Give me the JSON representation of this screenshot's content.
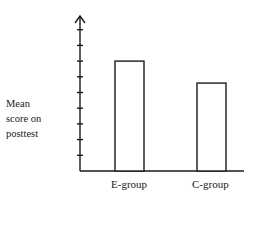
{
  "chart_data": {
    "type": "bar",
    "title": "",
    "xlabel": "",
    "ylabel": "Mean score on posttest",
    "ylabel_lines": [
      "Mean",
      "score on",
      "posttest"
    ],
    "categories": [
      "E-group",
      "C-group"
    ],
    "values": [
      7,
      5.6
    ],
    "ylim": [
      0,
      10
    ],
    "y_ticks_count": 9,
    "y_tick_labels": [],
    "grid": false,
    "legend": null,
    "bar_style": "outline",
    "colors": {
      "stroke": "#1a1a1a",
      "fill": "#ffffff"
    }
  }
}
